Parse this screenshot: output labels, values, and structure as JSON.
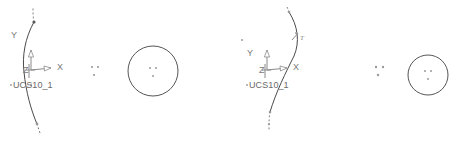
{
  "document": {
    "background_color": "#ffffff",
    "line_color": "#4a4a4a",
    "label_color": "#6a6a6a",
    "width": 451,
    "height": 141
  },
  "viewports": [
    {
      "id": "left",
      "name": "left-viewport",
      "ucs": {
        "label": "UCS10_1",
        "x_axis_label": "X",
        "y_axis_label": "Y",
        "z_axis_label": "Z",
        "origin_x": 30,
        "origin_y": 70
      },
      "arc": {
        "name": "primary-arc",
        "path": "M 34 22 C 25 38, 22 56, 24 72 C 26 92, 31 110, 37 124"
      },
      "arc_dotted_top": {
        "name": "arc-dotted-extension-top",
        "path": "M 34 22 C 33 17, 33 12, 33 8"
      },
      "arc_dotted_bottom": {
        "name": "arc-dotted-extension-bottom",
        "path": "M 37 124 C 38 127, 39 130, 40 133"
      },
      "node_markers": [
        {
          "cx": 34,
          "cy": 22,
          "r": 1.6,
          "dark": true
        },
        {
          "cx": 37,
          "cy": 124,
          "r": 1.4,
          "dark": false
        },
        {
          "cx": 31,
          "cy": 85,
          "r": 1.1,
          "dark": false
        }
      ],
      "dot_cluster": {
        "name": "dot-cluster",
        "dots": [
          {
            "cx": 92,
            "cy": 67,
            "r": 1.1
          },
          {
            "cx": 98,
            "cy": 67,
            "r": 1.1
          },
          {
            "cx": 94,
            "cy": 75,
            "r": 1.1
          }
        ]
      },
      "circle": {
        "name": "circle-entity",
        "cx": 153,
        "cy": 71,
        "r": 25,
        "center_dots": [
          {
            "cx": 150,
            "cy": 68,
            "r": 1.0
          },
          {
            "cx": 156,
            "cy": 68,
            "r": 1.0
          },
          {
            "cx": 153,
            "cy": 76,
            "r": 1.0
          }
        ]
      },
      "stray_dots": []
    },
    {
      "id": "right",
      "name": "right-viewport",
      "ucs": {
        "label": "UCS10_1",
        "x_axis_label": "X",
        "y_axis_label": "Y",
        "z_axis_label": "Z",
        "origin_x": 40,
        "origin_y": 70
      },
      "arc": {
        "name": "primary-arc",
        "path": "M 63 12 C 72 26, 74 42, 68 56 C 60 72, 50 92, 44 112"
      },
      "arc_dotted_top": {
        "name": "arc-dotted-extension-top",
        "path": "M 63 12 C 62 9, 61 7, 60 5"
      },
      "arc_dotted_bottom": {
        "name": "arc-dotted-extension-bottom",
        "path": "M 44 112 C 43 117, 43 123, 43 129"
      },
      "leader": {
        "name": "leader-tick",
        "path": "M 66 40 L 72 33",
        "label": "T",
        "label_x": 74,
        "label_y": 40
      },
      "node_markers": [
        {
          "cx": 63,
          "cy": 12,
          "r": 1.3,
          "dark": false
        },
        {
          "cx": 44,
          "cy": 112,
          "r": 1.3,
          "dark": false
        },
        {
          "cx": 43,
          "cy": 124,
          "r": 1.1,
          "dark": false
        }
      ],
      "dot_cluster": {
        "name": "dot-cluster",
        "dots": [
          {
            "cx": 150,
            "cy": 67,
            "r": 1.2
          },
          {
            "cx": 157,
            "cy": 67,
            "r": 1.2
          },
          {
            "cx": 152,
            "cy": 75,
            "r": 1.2
          }
        ]
      },
      "circle": {
        "name": "circle-entity",
        "cx": 202,
        "cy": 75,
        "r": 20,
        "center_dots": [
          {
            "cx": 199,
            "cy": 71,
            "r": 1.0
          },
          {
            "cx": 205,
            "cy": 71,
            "r": 1.0
          },
          {
            "cx": 202,
            "cy": 79,
            "r": 1.0
          }
        ]
      },
      "stray_dots": [
        {
          "cx": 70,
          "cy": 33,
          "r": 1.0
        },
        {
          "cx": 16,
          "cy": 40,
          "r": 1.0
        }
      ]
    }
  ]
}
